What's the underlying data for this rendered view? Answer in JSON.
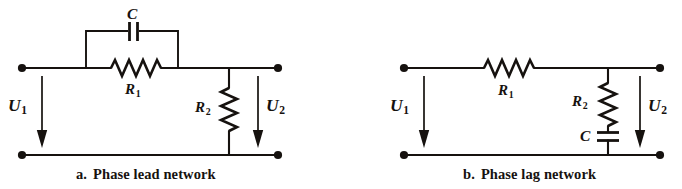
{
  "figure": {
    "type": "electrical-circuit-schematic",
    "background_color": "#ffffff",
    "ink_color": "#16120f",
    "panel_count": 2
  },
  "panels": [
    {
      "id": "a",
      "enumerator": "a.",
      "caption": "Phase lead network",
      "topology": "R1 with parallel C in series branch, R2 shunt to output",
      "components": [
        {
          "name": "C",
          "label": "C",
          "kind": "capacitor",
          "orientation": "vertical-plates",
          "placement": "parallel-bypass-above-R1",
          "label_position": "above"
        },
        {
          "name": "R1",
          "label": "R",
          "subscript": "1",
          "kind": "resistor",
          "orientation": "horizontal",
          "placement": "series-top-rail",
          "label_position": "below"
        },
        {
          "name": "R2",
          "label": "R",
          "subscript": "2",
          "kind": "resistor",
          "orientation": "vertical",
          "placement": "shunt-output",
          "label_position": "left"
        }
      ],
      "ports": [
        {
          "name": "U1",
          "label": "U",
          "subscript": "1",
          "kind": "voltage",
          "side": "input",
          "arrow_direction": "down"
        },
        {
          "name": "U2",
          "label": "U",
          "subscript": "2",
          "kind": "voltage",
          "side": "output",
          "arrow_direction": "down"
        }
      ],
      "terminals": 4
    },
    {
      "id": "b",
      "enumerator": "b.",
      "caption": "Phase lag network",
      "topology": "R1 in series, R2 and C in series as shunt to output",
      "components": [
        {
          "name": "R1",
          "label": "R",
          "subscript": "1",
          "kind": "resistor",
          "orientation": "horizontal",
          "placement": "series-top-rail",
          "label_position": "below"
        },
        {
          "name": "R2",
          "label": "R",
          "subscript": "2",
          "kind": "resistor",
          "orientation": "vertical",
          "placement": "shunt-upper",
          "label_position": "left"
        },
        {
          "name": "C",
          "label": "C",
          "kind": "capacitor",
          "orientation": "horizontal-plates",
          "placement": "shunt-lower-series-with-R2",
          "label_position": "left"
        }
      ],
      "ports": [
        {
          "name": "U1",
          "label": "U",
          "subscript": "1",
          "kind": "voltage",
          "side": "input",
          "arrow_direction": "down"
        },
        {
          "name": "U2",
          "label": "U",
          "subscript": "2",
          "kind": "voltage",
          "side": "output",
          "arrow_direction": "down"
        }
      ],
      "terminals": 4
    }
  ],
  "labels": {
    "a_C": "C",
    "a_R1_base": "R",
    "a_R1_sub": "1",
    "a_R2_base": "R",
    "a_R2_sub": "2",
    "a_U1_base": "U",
    "a_U1_sub": "1",
    "a_U2_base": "U",
    "a_U2_sub": "2",
    "b_R1_base": "R",
    "b_R1_sub": "1",
    "b_R2_base": "R",
    "b_R2_sub": "2",
    "b_C": "C",
    "b_U1_base": "U",
    "b_U1_sub": "1",
    "b_U2_base": "U",
    "b_U2_sub": "2"
  },
  "captions": {
    "a_enum": "a.",
    "a_text": "Phase lead network",
    "b_enum": "b.",
    "b_text": "Phase lag network"
  }
}
